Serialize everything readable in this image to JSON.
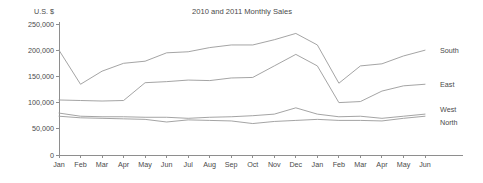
{
  "chart_data": {
    "type": "line",
    "title": "2010 and 2011 Monthly Sales",
    "xlabel": "",
    "ylabel": "U.S. $",
    "ylim": [
      0,
      250000
    ],
    "yticks": [
      0,
      50000,
      100000,
      150000,
      200000,
      250000
    ],
    "ytick_labels": [
      "0",
      "50,000",
      "100,000",
      "150,000",
      "200,000",
      "250,000"
    ],
    "grid": false,
    "legend_position": "right-inline-labels",
    "categories": [
      "Jan",
      "Feb",
      "Mar",
      "Apr",
      "May",
      "Jun",
      "Jul",
      "Aug",
      "Sep",
      "Oct",
      "Nov",
      "Dec",
      "Jan",
      "Feb",
      "Mar",
      "Apr",
      "May",
      "Jun"
    ],
    "series": [
      {
        "name": "South",
        "color": "#9a9a9a",
        "values": [
          200000,
          135000,
          160000,
          175000,
          179000,
          195000,
          197000,
          205000,
          210000,
          210000,
          220000,
          232000,
          210000,
          137000,
          170000,
          174000,
          189000,
          200000
        ]
      },
      {
        "name": "East",
        "color": "#9a9a9a",
        "values": [
          105000,
          104000,
          103000,
          104000,
          138000,
          140000,
          143000,
          142000,
          147000,
          148000,
          170000,
          192000,
          170000,
          100000,
          102000,
          122000,
          132000,
          135000
        ]
      },
      {
        "name": "West",
        "color": "#9a9a9a",
        "values": [
          80000,
          74000,
          73000,
          73000,
          72000,
          72000,
          70000,
          72000,
          73000,
          75000,
          78000,
          90000,
          78000,
          73000,
          74000,
          70000,
          74000,
          78000
        ]
      },
      {
        "name": "North",
        "color": "#9a9a9a",
        "values": [
          74000,
          71000,
          70000,
          69000,
          68000,
          63000,
          67000,
          66000,
          65000,
          60000,
          64000,
          66000,
          68000,
          66000,
          66000,
          65000,
          70000,
          74000
        ]
      }
    ]
  },
  "axis_titles": {
    "y_unit": "U.S. $"
  }
}
